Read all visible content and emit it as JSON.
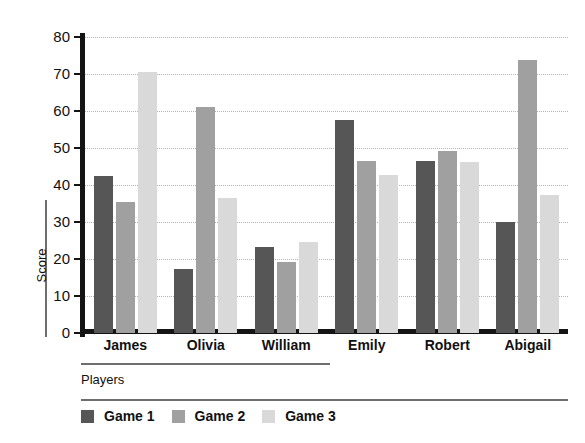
{
  "chart_data": {
    "type": "bar",
    "title": "",
    "xlabel": "Players",
    "ylabel": "Score",
    "ylim": [
      0,
      80
    ],
    "yticks": [
      0,
      10,
      20,
      30,
      40,
      50,
      60,
      70,
      80
    ],
    "grid": true,
    "legend_position": "bottom-left",
    "categories": [
      "James",
      "Olivia",
      "William",
      "Emily",
      "Robert",
      "Abigail"
    ],
    "series": [
      {
        "name": "Game 1",
        "color": "#565656",
        "values": [
          42.4,
          17.4,
          23.3,
          57.5,
          46.6,
          29.9
        ]
      },
      {
        "name": "Game 2",
        "color": "#a0a0a0",
        "values": [
          35.4,
          61.2,
          19.3,
          46.6,
          49.1,
          73.8
        ]
      },
      {
        "name": "Game 3",
        "color": "#d9d9d9",
        "values": [
          70.5,
          36.6,
          24.6,
          42.7,
          46.2,
          37.3
        ]
      }
    ]
  },
  "axes": {
    "y_title": "Score",
    "x_title": "Players",
    "tick_labels": [
      "0",
      "10",
      "20",
      "30",
      "40",
      "50",
      "60",
      "70",
      "80"
    ]
  },
  "legend": {
    "items": [
      {
        "label": "Game 1",
        "color": "#565656"
      },
      {
        "label": "Game 2",
        "color": "#a0a0a0"
      },
      {
        "label": "Game 3",
        "color": "#d9d9d9"
      }
    ]
  },
  "colors": {
    "axis": "#141414",
    "grid": "#b4b4b4",
    "rule": "#6e6e6e",
    "background": "#ffffff"
  }
}
